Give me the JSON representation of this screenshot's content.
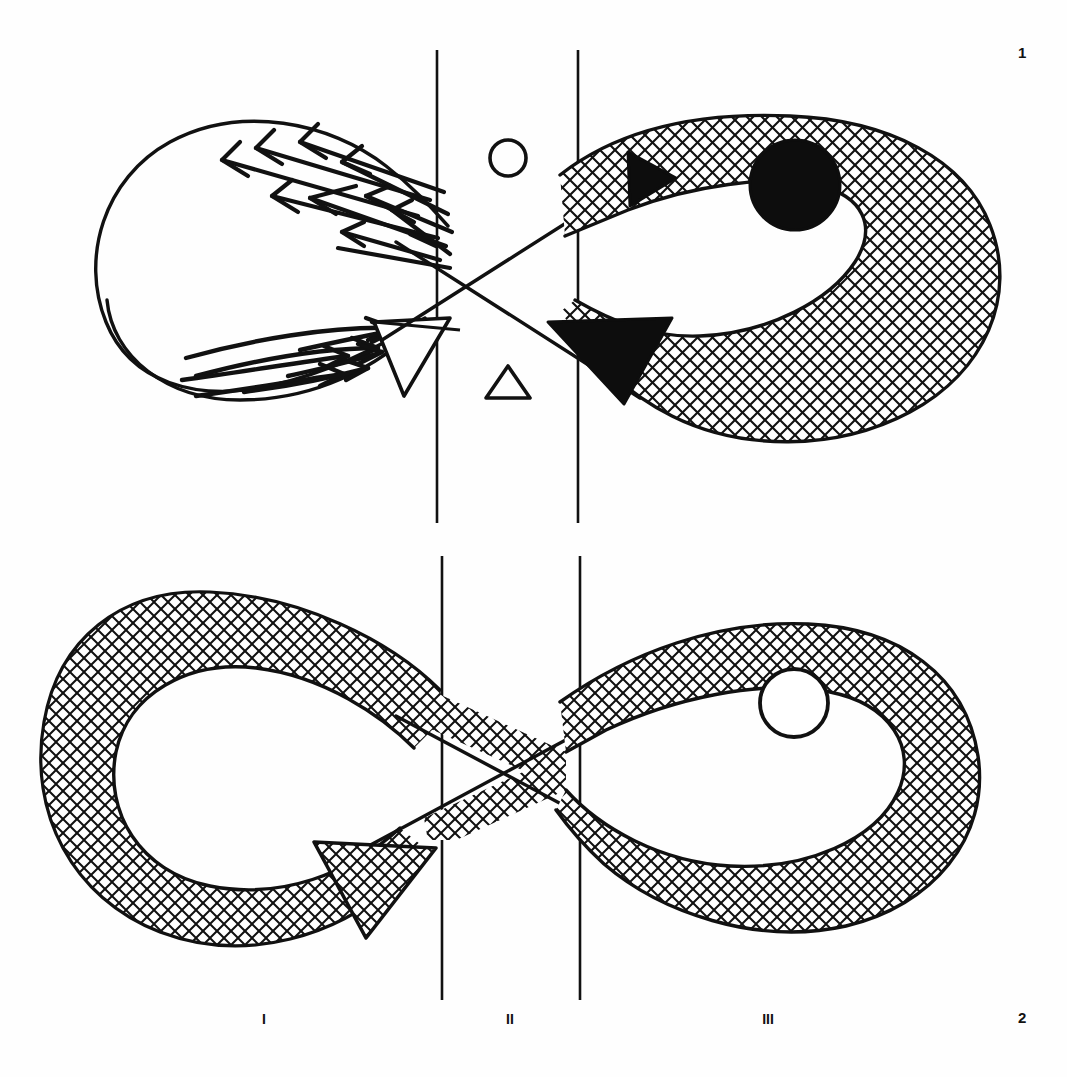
{
  "figure": {
    "background_color": "#fefefe",
    "ink_color": "#111111",
    "panels": [
      {
        "id": "panel-1",
        "number_label": "1",
        "description": "Upper lemniscate: left loop unshaded with arrow swarms, right loop cross-hatched with solid black core",
        "left_loop": {
          "fill": "unshaded",
          "arrow_groups": [
            {
              "name": "upper-arrow-swarm",
              "direction": "up-left",
              "count": 9
            },
            {
              "name": "lower-arrow-swarm",
              "direction": "right",
              "count": 8
            }
          ],
          "arrowhead": {
            "style": "hollow",
            "direction": "right"
          }
        },
        "right_loop": {
          "fill": "cross-hatched",
          "core": {
            "shape": "circle",
            "fill": "solid-black",
            "name": "solid-core"
          },
          "arrowheads": [
            {
              "style": "solid-black",
              "direction": "left",
              "position": "upper-band"
            },
            {
              "style": "solid-black",
              "direction": "down-left",
              "position": "lower-band"
            }
          ]
        },
        "center_symbols": [
          {
            "name": "circle-symbol",
            "shape": "circle",
            "fill": "hollow"
          },
          {
            "name": "triangle-symbol",
            "shape": "triangle",
            "fill": "hollow"
          }
        ]
      },
      {
        "id": "panel-2",
        "number_label": "2",
        "description": "Lower lemniscate: both loops cross-hatched, right loop with hollow circular core",
        "left_loop": {
          "fill": "cross-hatched",
          "arrowhead": {
            "style": "cross-hatched",
            "direction": "down-left"
          }
        },
        "right_loop": {
          "fill": "cross-hatched",
          "core": {
            "shape": "circle",
            "fill": "hollow",
            "name": "hollow-core"
          }
        },
        "center_symbols": []
      }
    ],
    "zone_labels": [
      "I",
      "II",
      "III"
    ],
    "zone_boundaries": {
      "count": 2,
      "panel_1": {
        "x_left": 437,
        "x_right": 578,
        "y_top": 50,
        "y_bottom": 523
      },
      "panel_2": {
        "x_left": 442,
        "x_right": 580,
        "y_top": 556,
        "y_bottom": 1000
      }
    },
    "colors": {
      "ink": "#111111",
      "paper": "#fefefe",
      "solid_fill": "#0d0d0d"
    }
  }
}
